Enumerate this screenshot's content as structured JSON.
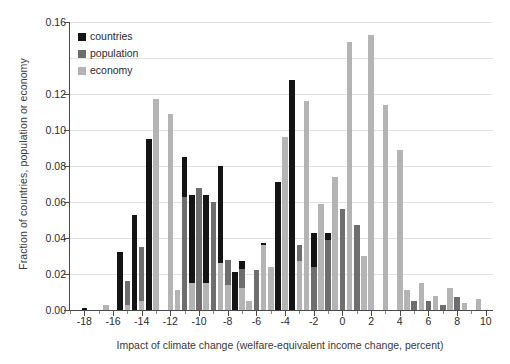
{
  "chart_data": {
    "type": "bar",
    "title": "",
    "subtitle": "",
    "xlabel": "Impact of climate change (welfare-equivalent income change, percent)",
    "ylabel": "Fraction of countries, population or economy",
    "xlim": [
      -19,
      10.5
    ],
    "ylim": [
      0.0,
      0.16
    ],
    "grid": true,
    "legend_position": "top-left",
    "bin_width": 0.5,
    "yticks": [
      0.0,
      0.02,
      0.04,
      0.06,
      0.08,
      0.1,
      0.12,
      0.16
    ],
    "ytick_labels": [
      "0.00",
      "0.02",
      "0.04",
      "0.06",
      "0.08",
      "0.10",
      "0.12",
      "0.16"
    ],
    "gridline_values": [
      0.02,
      0.04,
      0.06,
      0.08,
      0.1,
      0.12,
      0.14,
      0.16
    ],
    "xticks": [
      -18,
      -16,
      -14,
      -12,
      -10,
      -8,
      -6,
      -4,
      -2,
      0,
      2,
      4,
      6,
      8,
      10
    ],
    "xtick_labels": [
      "-18",
      "-16",
      "-14",
      "-12",
      "-10",
      "-8",
      "-6",
      "-4",
      "-2",
      "0",
      "2",
      "4",
      "6",
      "8",
      "10"
    ],
    "colors": {
      "countries": "#141414",
      "population": "#6e6e6e",
      "economy": "#b4b4b4",
      "gridline": "#e2e2e2",
      "axis": "#4a4a4a",
      "background": "#ffffff"
    },
    "legend": [
      {
        "name": "countries",
        "color": "#141414"
      },
      {
        "name": "population",
        "color": "#6e6e6e"
      },
      {
        "name": "economy",
        "color": "#b4b4b4"
      }
    ],
    "x": [
      -18.5,
      -18.0,
      -17.5,
      -17.0,
      -16.5,
      -16.0,
      -15.5,
      -15.0,
      -14.5,
      -14.0,
      -13.5,
      -13.0,
      -12.5,
      -12.0,
      -11.5,
      -11.0,
      -10.5,
      -10.0,
      -9.5,
      -9.0,
      -8.5,
      -8.0,
      -7.5,
      -7.0,
      -6.5,
      -6.0,
      -5.5,
      -5.0,
      -4.5,
      -4.0,
      -3.5,
      -3.0,
      -2.5,
      -2.0,
      -1.5,
      -1.0,
      -0.5,
      0.0,
      0.5,
      1.0,
      1.5,
      2.0,
      2.5,
      3.0,
      3.5,
      4.0,
      4.5,
      5.0,
      5.5,
      6.0,
      6.5,
      7.0,
      7.5,
      8.0,
      8.5,
      9.0,
      9.5,
      10.0
    ],
    "series": [
      {
        "name": "countries",
        "color": "#141414",
        "values": [
          0.0,
          0.001,
          0.0,
          0.0,
          0.0,
          0.0,
          0.032,
          0.0,
          0.053,
          0.0,
          0.095,
          0.085,
          0.0,
          0.053,
          0.0,
          0.085,
          0.064,
          0.0,
          0.064,
          0.0,
          0.08,
          0.0,
          0.021,
          0.027,
          0.0,
          0.021,
          0.037,
          0.0,
          0.071,
          0.0,
          0.128,
          0.027,
          0.0,
          0.043,
          0.0,
          0.043,
          0.048,
          0.0,
          0.032,
          0.032,
          0.0,
          0.011,
          0.0,
          0.008,
          0.0,
          0.027,
          0.0,
          0.0,
          0.0,
          0.0,
          0.0,
          0.0,
          0.005,
          0.0,
          0.0,
          0.0,
          0.0,
          0.0
        ]
      },
      {
        "name": "population",
        "color": "#6e6e6e",
        "values": [
          0.0,
          0.0,
          0.0,
          0.0,
          0.0,
          0.0,
          0.0,
          0.016,
          0.0,
          0.035,
          0.0,
          0.095,
          0.0,
          0.064,
          0.0,
          0.063,
          0.0,
          0.068,
          0.0,
          0.06,
          0.0,
          0.028,
          0.0,
          0.023,
          0.0,
          0.022,
          0.0,
          0.023,
          0.0,
          0.037,
          0.0,
          0.036,
          0.0,
          0.024,
          0.0,
          0.039,
          0.0,
          0.056,
          0.0,
          0.047,
          0.0,
          0.021,
          0.0,
          0.014,
          0.0,
          0.014,
          0.0,
          0.005,
          0.0,
          0.005,
          0.0,
          0.003,
          0.0,
          0.007,
          0.0,
          0.0,
          0.0,
          0.0
        ]
      },
      {
        "name": "economy",
        "color": "#b4b4b4",
        "values": [
          0.0,
          0.0,
          0.0,
          0.0,
          0.003,
          0.0,
          0.0,
          0.003,
          0.0,
          0.005,
          0.0,
          0.117,
          0.0,
          0.109,
          0.011,
          0.0,
          0.015,
          0.0,
          0.015,
          0.0,
          0.026,
          0.014,
          0.0,
          0.012,
          0.005,
          0.0,
          0.036,
          0.024,
          0.0,
          0.096,
          0.0,
          0.027,
          0.116,
          0.0,
          0.059,
          0.0,
          0.074,
          0.0,
          0.149,
          0.0,
          0.03,
          0.153,
          0.0,
          0.114,
          0.0,
          0.089,
          0.011,
          0.0,
          0.015,
          0.0,
          0.008,
          0.0,
          0.012,
          0.0,
          0.004,
          0.0,
          0.006,
          0.0
        ]
      }
    ]
  }
}
